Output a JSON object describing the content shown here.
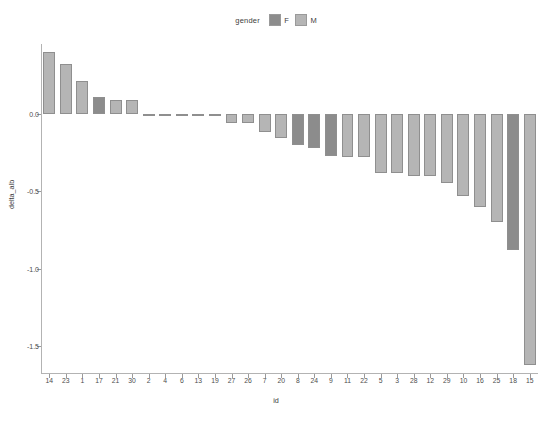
{
  "chart_data": {
    "type": "bar",
    "title": "",
    "xlabel": "id",
    "ylabel": "delta_alb",
    "legend_title": "gender",
    "legend_position": "top",
    "grid": false,
    "ylim": [
      -1.68,
      0.45
    ],
    "yticks": [
      0.0,
      -0.5,
      -1.0,
      -1.5
    ],
    "ytick_labels": [
      "0.0",
      "-0.5",
      "-1.0",
      "-1.5"
    ],
    "categories": [
      "14",
      "23",
      "1",
      "17",
      "21",
      "30",
      "2",
      "4",
      "6",
      "13",
      "19",
      "27",
      "26",
      "7",
      "20",
      "8",
      "24",
      "9",
      "11",
      "22",
      "5",
      "3",
      "28",
      "12",
      "29",
      "10",
      "16",
      "25",
      "18",
      "15"
    ],
    "values": [
      0.4,
      0.32,
      0.21,
      0.11,
      0.09,
      0.09,
      0.0,
      0.0,
      0.0,
      0.0,
      0.0,
      -0.06,
      -0.06,
      -0.12,
      -0.16,
      -0.2,
      -0.22,
      -0.27,
      -0.28,
      -0.28,
      -0.38,
      -0.38,
      -0.4,
      -0.4,
      -0.45,
      -0.53,
      -0.6,
      -0.7,
      -0.88,
      -1.62
    ],
    "groups": [
      "M",
      "M",
      "M",
      "F",
      "M",
      "M",
      "M",
      "M",
      "M",
      "M",
      "M",
      "M",
      "M",
      "M",
      "M",
      "F",
      "F",
      "F",
      "M",
      "M",
      "M",
      "M",
      "M",
      "M",
      "M",
      "M",
      "M",
      "M",
      "F",
      "M"
    ],
    "legend_entries": [
      {
        "label": "F",
        "color": "#8c8c8c"
      },
      {
        "label": "M",
        "color": "#b5b5b5"
      }
    ],
    "colors": {
      "F": "#8c8c8c",
      "M": "#b5b5b5",
      "bar_border": "#8f8f8f",
      "axis": "#b3b3b3",
      "text": "#4d4d4d",
      "background": "#ffffff"
    }
  }
}
